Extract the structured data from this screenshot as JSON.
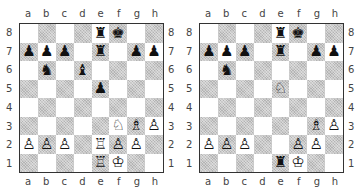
{
  "files": [
    "a",
    "b",
    "c",
    "d",
    "e",
    "f",
    "g",
    "h"
  ],
  "ranks": [
    "8",
    "7",
    "6",
    "5",
    "4",
    "3",
    "2",
    "1"
  ],
  "glyphs": {
    "K": "♔",
    "Q": "♕",
    "R": "♖",
    "B": "♗",
    "N": "♘",
    "P": "♙",
    "k": "♚",
    "q": "♛",
    "r": "♜",
    "b": "♝",
    "n": "♞",
    "p": "♟"
  },
  "colors": {
    "light_square": "#ffffff",
    "dark_square": "#c8c8c8",
    "border": "#333333"
  },
  "diagrams": [
    {
      "name": "left-diagram",
      "board": [
        [
          "",
          "",
          "",
          "",
          "r",
          "k",
          "",
          ""
        ],
        [
          "p",
          "p",
          "p",
          "",
          "r",
          "",
          "p",
          "p"
        ],
        [
          "",
          "n",
          "",
          "b",
          "",
          "",
          "",
          ""
        ],
        [
          "",
          "",
          "",
          "",
          "p",
          "",
          "",
          ""
        ],
        [
          "",
          "",
          "",
          "",
          "",
          "",
          "",
          ""
        ],
        [
          "",
          "",
          "",
          "",
          "",
          "N",
          "B",
          "P"
        ],
        [
          "P",
          "P",
          "P",
          "",
          "R",
          "P",
          "P",
          ""
        ],
        [
          "",
          "",
          "",
          "",
          "R",
          "K",
          "",
          ""
        ]
      ]
    },
    {
      "name": "right-diagram",
      "board": [
        [
          "",
          "",
          "",
          "",
          "r",
          "k",
          "",
          ""
        ],
        [
          "p",
          "p",
          "p",
          "",
          "r",
          "",
          "p",
          "p"
        ],
        [
          "",
          "n",
          "",
          "",
          "",
          "",
          "",
          ""
        ],
        [
          "",
          "",
          "",
          "",
          "N",
          "",
          "",
          ""
        ],
        [
          "",
          "",
          "",
          "",
          "",
          "",
          "",
          ""
        ],
        [
          "",
          "",
          "",
          "",
          "",
          "",
          "B",
          "P"
        ],
        [
          "P",
          "P",
          "P",
          "",
          "",
          "P",
          "P",
          ""
        ],
        [
          "",
          "",
          "",
          "",
          "r",
          "K",
          "",
          ""
        ]
      ]
    }
  ]
}
